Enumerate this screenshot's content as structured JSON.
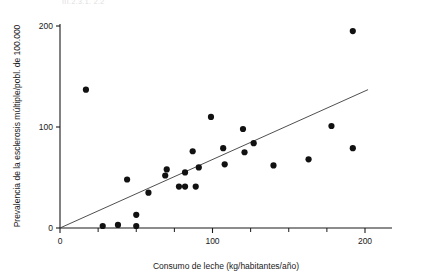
{
  "chart_data": {
    "type": "scatter",
    "title": "",
    "xlabel": "Consumo de leche (kg/habitantes/año)",
    "ylabel": "Prevalencia de la esclerosis múltiple/pobl. de 100.000",
    "xlim": [
      0,
      215
    ],
    "ylim": [
      0,
      210
    ],
    "xticks": [
      0,
      100,
      200
    ],
    "yticks": [
      0,
      100,
      200
    ],
    "xticklabels": [
      "0",
      "100",
      "200"
    ],
    "yticklabels": [
      "0",
      "100",
      "200"
    ],
    "xminor_step": 25,
    "grid": false,
    "legend": null,
    "series": [
      {
        "name": "Países",
        "marker": "filled-circle",
        "color": "#111111",
        "points": [
          [
            17,
            137
          ],
          [
            28,
            2
          ],
          [
            38,
            3
          ],
          [
            44,
            48
          ],
          [
            50,
            2
          ],
          [
            50,
            13
          ],
          [
            58,
            35
          ],
          [
            70,
            58
          ],
          [
            69,
            52
          ],
          [
            78,
            41
          ],
          [
            82,
            41
          ],
          [
            82,
            55
          ],
          [
            87,
            76
          ],
          [
            89,
            41
          ],
          [
            91,
            60
          ],
          [
            99,
            110
          ],
          [
            107,
            79
          ],
          [
            108,
            63
          ],
          [
            120,
            98
          ],
          [
            121,
            75
          ],
          [
            127,
            84
          ],
          [
            140,
            62
          ],
          [
            163,
            68
          ],
          [
            178,
            101
          ],
          [
            192,
            195
          ],
          [
            192,
            79
          ]
        ]
      }
    ],
    "fit_line": {
      "type": "linear-regression",
      "x_start": 0,
      "y_start": 0,
      "x_end": 202,
      "y_end": 137,
      "color": "#3b3b3b"
    }
  },
  "ghost_header": "III.2.3.1. 2.2"
}
